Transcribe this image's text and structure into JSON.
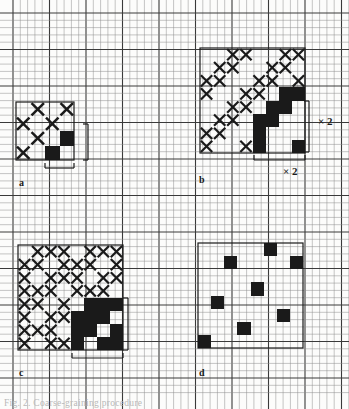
{
  "figure": {
    "kind": "grid-pattern-diagram",
    "background_color": "#fcfcfb",
    "ink_color": "#1a1a1a",
    "grid": {
      "minor_color": "#8d8d8d",
      "major_color": "#3a3a3a",
      "minor_step_px": 7.3,
      "major_every": 5,
      "x_origin": 13,
      "y_origin": 13,
      "cols": 46,
      "rows": 52,
      "minor_width": 0.5,
      "major_width": 1.1
    },
    "caption": "Fig. 2. Coarse-graining procedure",
    "annotations": [
      {
        "name": "scale-label-b-vertical",
        "text": "× 2",
        "x": 318,
        "y": 125
      },
      {
        "name": "scale-label-b-horizontal",
        "text": "× 2",
        "x": 283,
        "y": 175
      }
    ],
    "panels": [
      {
        "id": "a",
        "label": "a",
        "label_x": 19,
        "label_y": 186,
        "x": 16,
        "y": 102,
        "size": 58,
        "n": 4,
        "cells": [
          {
            "r": 0,
            "c": 0,
            "fill": "white"
          },
          {
            "r": 0,
            "c": 1,
            "fill": "cross"
          },
          {
            "r": 0,
            "c": 2,
            "fill": "white"
          },
          {
            "r": 0,
            "c": 3,
            "fill": "cross"
          },
          {
            "r": 1,
            "c": 0,
            "fill": "cross"
          },
          {
            "r": 1,
            "c": 1,
            "fill": "white"
          },
          {
            "r": 1,
            "c": 2,
            "fill": "cross"
          },
          {
            "r": 1,
            "c": 3,
            "fill": "white"
          },
          {
            "r": 2,
            "c": 0,
            "fill": "white"
          },
          {
            "r": 2,
            "c": 1,
            "fill": "cross"
          },
          {
            "r": 2,
            "c": 2,
            "fill": "white"
          },
          {
            "r": 2,
            "c": 3,
            "fill": "black"
          },
          {
            "r": 3,
            "c": 0,
            "fill": "cross"
          },
          {
            "r": 3,
            "c": 1,
            "fill": "white"
          },
          {
            "r": 3,
            "c": 2,
            "fill": "black"
          },
          {
            "r": 3,
            "c": 3,
            "fill": "white"
          }
        ],
        "brackets": [
          {
            "name": "bracket-a-vertical",
            "orient": "v",
            "x": 88,
            "y0": 124,
            "y1": 160,
            "tick": 5
          },
          {
            "name": "bracket-a-horizontal",
            "orient": "h",
            "y": 168,
            "x0": 45,
            "x1": 74,
            "tick": 5
          }
        ]
      },
      {
        "id": "b",
        "label": "b",
        "label_x": 199,
        "label_y": 183,
        "x": 200,
        "y": 48,
        "size": 105,
        "n": 8,
        "cells": [
          {
            "r": 0,
            "c": 0,
            "fill": "white"
          },
          {
            "r": 0,
            "c": 1,
            "fill": "white"
          },
          {
            "r": 0,
            "c": 2,
            "fill": "cross"
          },
          {
            "r": 0,
            "c": 3,
            "fill": "cross"
          },
          {
            "r": 0,
            "c": 4,
            "fill": "white"
          },
          {
            "r": 0,
            "c": 5,
            "fill": "white"
          },
          {
            "r": 0,
            "c": 6,
            "fill": "cross"
          },
          {
            "r": 0,
            "c": 7,
            "fill": "cross"
          },
          {
            "r": 1,
            "c": 0,
            "fill": "white"
          },
          {
            "r": 1,
            "c": 1,
            "fill": "cross"
          },
          {
            "r": 1,
            "c": 2,
            "fill": "cross"
          },
          {
            "r": 1,
            "c": 3,
            "fill": "white"
          },
          {
            "r": 1,
            "c": 4,
            "fill": "white"
          },
          {
            "r": 1,
            "c": 5,
            "fill": "cross"
          },
          {
            "r": 1,
            "c": 6,
            "fill": "cross"
          },
          {
            "r": 1,
            "c": 7,
            "fill": "white"
          },
          {
            "r": 2,
            "c": 0,
            "fill": "cross"
          },
          {
            "r": 2,
            "c": 1,
            "fill": "cross"
          },
          {
            "r": 2,
            "c": 2,
            "fill": "white"
          },
          {
            "r": 2,
            "c": 3,
            "fill": "white"
          },
          {
            "r": 2,
            "c": 4,
            "fill": "cross"
          },
          {
            "r": 2,
            "c": 5,
            "fill": "cross"
          },
          {
            "r": 2,
            "c": 6,
            "fill": "white"
          },
          {
            "r": 2,
            "c": 7,
            "fill": "cross"
          },
          {
            "r": 3,
            "c": 0,
            "fill": "cross"
          },
          {
            "r": 3,
            "c": 1,
            "fill": "white"
          },
          {
            "r": 3,
            "c": 2,
            "fill": "white"
          },
          {
            "r": 3,
            "c": 3,
            "fill": "cross"
          },
          {
            "r": 3,
            "c": 4,
            "fill": "cross"
          },
          {
            "r": 3,
            "c": 5,
            "fill": "white"
          },
          {
            "r": 3,
            "c": 6,
            "fill": "black"
          },
          {
            "r": 3,
            "c": 7,
            "fill": "black"
          },
          {
            "r": 4,
            "c": 0,
            "fill": "white"
          },
          {
            "r": 4,
            "c": 1,
            "fill": "white"
          },
          {
            "r": 4,
            "c": 2,
            "fill": "cross"
          },
          {
            "r": 4,
            "c": 3,
            "fill": "cross"
          },
          {
            "r": 4,
            "c": 4,
            "fill": "white"
          },
          {
            "r": 4,
            "c": 5,
            "fill": "black"
          },
          {
            "r": 4,
            "c": 6,
            "fill": "black"
          },
          {
            "r": 4,
            "c": 7,
            "fill": "white"
          },
          {
            "r": 5,
            "c": 0,
            "fill": "white"
          },
          {
            "r": 5,
            "c": 1,
            "fill": "cross"
          },
          {
            "r": 5,
            "c": 2,
            "fill": "cross"
          },
          {
            "r": 5,
            "c": 3,
            "fill": "white"
          },
          {
            "r": 5,
            "c": 4,
            "fill": "black"
          },
          {
            "r": 5,
            "c": 5,
            "fill": "black"
          },
          {
            "r": 5,
            "c": 6,
            "fill": "white"
          },
          {
            "r": 5,
            "c": 7,
            "fill": "white"
          },
          {
            "r": 6,
            "c": 0,
            "fill": "cross"
          },
          {
            "r": 6,
            "c": 1,
            "fill": "cross"
          },
          {
            "r": 6,
            "c": 2,
            "fill": "white"
          },
          {
            "r": 6,
            "c": 3,
            "fill": "white"
          },
          {
            "r": 6,
            "c": 4,
            "fill": "black"
          },
          {
            "r": 6,
            "c": 5,
            "fill": "white"
          },
          {
            "r": 6,
            "c": 6,
            "fill": "white"
          },
          {
            "r": 6,
            "c": 7,
            "fill": "white"
          },
          {
            "r": 7,
            "c": 0,
            "fill": "cross"
          },
          {
            "r": 7,
            "c": 1,
            "fill": "white"
          },
          {
            "r": 7,
            "c": 2,
            "fill": "white"
          },
          {
            "r": 7,
            "c": 3,
            "fill": "cross"
          },
          {
            "r": 7,
            "c": 4,
            "fill": "black"
          },
          {
            "r": 7,
            "c": 5,
            "fill": "white"
          },
          {
            "r": 7,
            "c": 6,
            "fill": "white"
          },
          {
            "r": 7,
            "c": 7,
            "fill": "black"
          }
        ],
        "brackets": [
          {
            "name": "bracket-b-vertical",
            "orient": "v",
            "x": 309,
            "y0": 101,
            "y1": 152,
            "tick": 5
          },
          {
            "name": "bracket-b-horizontal",
            "orient": "h",
            "y": 160,
            "x0": 254,
            "x1": 305,
            "tick": 5
          }
        ]
      },
      {
        "id": "c",
        "label": "c",
        "label_x": 19,
        "label_y": 376,
        "x": 18,
        "y": 245,
        "size": 105,
        "n": 8,
        "cells": [
          {
            "r": 0,
            "c": 0,
            "fill": "white"
          },
          {
            "r": 0,
            "c": 1,
            "fill": "cross"
          },
          {
            "r": 0,
            "c": 2,
            "fill": "cross"
          },
          {
            "r": 0,
            "c": 3,
            "fill": "cross"
          },
          {
            "r": 0,
            "c": 4,
            "fill": "white"
          },
          {
            "r": 0,
            "c": 5,
            "fill": "cross"
          },
          {
            "r": 0,
            "c": 6,
            "fill": "cross"
          },
          {
            "r": 0,
            "c": 7,
            "fill": "cross"
          },
          {
            "r": 1,
            "c": 0,
            "fill": "cross"
          },
          {
            "r": 1,
            "c": 1,
            "fill": "cross"
          },
          {
            "r": 1,
            "c": 2,
            "fill": "white"
          },
          {
            "r": 1,
            "c": 3,
            "fill": "cross"
          },
          {
            "r": 1,
            "c": 4,
            "fill": "cross"
          },
          {
            "r": 1,
            "c": 5,
            "fill": "cross"
          },
          {
            "r": 1,
            "c": 6,
            "fill": "white"
          },
          {
            "r": 1,
            "c": 7,
            "fill": "cross"
          },
          {
            "r": 2,
            "c": 0,
            "fill": "cross"
          },
          {
            "r": 2,
            "c": 1,
            "fill": "white"
          },
          {
            "r": 2,
            "c": 2,
            "fill": "cross"
          },
          {
            "r": 2,
            "c": 3,
            "fill": "cross"
          },
          {
            "r": 2,
            "c": 4,
            "fill": "cross"
          },
          {
            "r": 2,
            "c": 5,
            "fill": "white"
          },
          {
            "r": 2,
            "c": 6,
            "fill": "cross"
          },
          {
            "r": 2,
            "c": 7,
            "fill": "cross"
          },
          {
            "r": 3,
            "c": 0,
            "fill": "cross"
          },
          {
            "r": 3,
            "c": 1,
            "fill": "cross"
          },
          {
            "r": 3,
            "c": 2,
            "fill": "cross"
          },
          {
            "r": 3,
            "c": 3,
            "fill": "white"
          },
          {
            "r": 3,
            "c": 4,
            "fill": "cross"
          },
          {
            "r": 3,
            "c": 5,
            "fill": "cross"
          },
          {
            "r": 3,
            "c": 6,
            "fill": "cross"
          },
          {
            "r": 3,
            "c": 7,
            "fill": "white"
          },
          {
            "r": 4,
            "c": 0,
            "fill": "cross"
          },
          {
            "r": 4,
            "c": 1,
            "fill": "cross"
          },
          {
            "r": 4,
            "c": 2,
            "fill": "white"
          },
          {
            "r": 4,
            "c": 3,
            "fill": "cross"
          },
          {
            "r": 4,
            "c": 4,
            "fill": "white"
          },
          {
            "r": 4,
            "c": 5,
            "fill": "black"
          },
          {
            "r": 4,
            "c": 6,
            "fill": "black"
          },
          {
            "r": 4,
            "c": 7,
            "fill": "black"
          },
          {
            "r": 5,
            "c": 0,
            "fill": "cross"
          },
          {
            "r": 5,
            "c": 1,
            "fill": "white"
          },
          {
            "r": 5,
            "c": 2,
            "fill": "cross"
          },
          {
            "r": 5,
            "c": 3,
            "fill": "cross"
          },
          {
            "r": 5,
            "c": 4,
            "fill": "black"
          },
          {
            "r": 5,
            "c": 5,
            "fill": "black"
          },
          {
            "r": 5,
            "c": 6,
            "fill": "black"
          },
          {
            "r": 5,
            "c": 7,
            "fill": "white"
          },
          {
            "r": 6,
            "c": 0,
            "fill": "cross"
          },
          {
            "r": 6,
            "c": 1,
            "fill": "cross"
          },
          {
            "r": 6,
            "c": 2,
            "fill": "cross"
          },
          {
            "r": 6,
            "c": 3,
            "fill": "white"
          },
          {
            "r": 6,
            "c": 4,
            "fill": "black"
          },
          {
            "r": 6,
            "c": 5,
            "fill": "black"
          },
          {
            "r": 6,
            "c": 6,
            "fill": "white"
          },
          {
            "r": 6,
            "c": 7,
            "fill": "black"
          },
          {
            "r": 7,
            "c": 0,
            "fill": "cross"
          },
          {
            "r": 7,
            "c": 1,
            "fill": "white"
          },
          {
            "r": 7,
            "c": 2,
            "fill": "cross"
          },
          {
            "r": 7,
            "c": 3,
            "fill": "cross"
          },
          {
            "r": 7,
            "c": 4,
            "fill": "black"
          },
          {
            "r": 7,
            "c": 5,
            "fill": "white"
          },
          {
            "r": 7,
            "c": 6,
            "fill": "black"
          },
          {
            "r": 7,
            "c": 7,
            "fill": "black"
          }
        ],
        "brackets": [
          {
            "name": "bracket-c-vertical",
            "orient": "v",
            "x": 128,
            "y0": 298,
            "y1": 350,
            "tick": 5
          },
          {
            "name": "bracket-c-horizontal",
            "orient": "h",
            "y": 358,
            "x0": 72,
            "x1": 123,
            "tick": 5
          }
        ]
      },
      {
        "id": "d",
        "label": "d",
        "label_x": 199,
        "label_y": 376,
        "x": 198,
        "y": 243,
        "size": 105,
        "n": 8,
        "cells": [
          {
            "r": 0,
            "c": 5,
            "fill": "black"
          },
          {
            "r": 1,
            "c": 2,
            "fill": "black"
          },
          {
            "r": 1,
            "c": 7,
            "fill": "black"
          },
          {
            "r": 3,
            "c": 4,
            "fill": "black"
          },
          {
            "r": 4,
            "c": 1,
            "fill": "black"
          },
          {
            "r": 5,
            "c": 6,
            "fill": "black"
          },
          {
            "r": 6,
            "c": 3,
            "fill": "black"
          },
          {
            "r": 7,
            "c": 0,
            "fill": "black"
          }
        ],
        "brackets": []
      }
    ]
  }
}
